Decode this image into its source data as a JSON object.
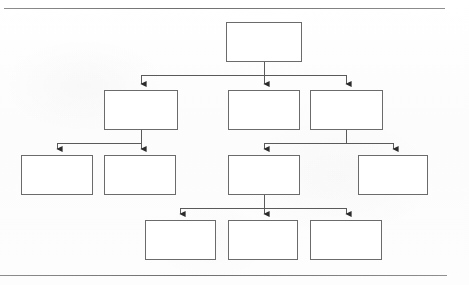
{
  "page": {
    "width": 469,
    "height": 285,
    "background_color": "#fdfdfd",
    "kind": "scanned-hierarchy-diagram"
  },
  "frame": {
    "top_rule": {
      "x": 4,
      "y": 8,
      "width": 441,
      "color": "#6f6f6f"
    },
    "bottom_rule": {
      "x": 0,
      "y": 275,
      "width": 447,
      "color": "#6f6f6f"
    }
  },
  "style": {
    "node_fill": "#ffffff",
    "node_border_color": "#6b6b6b",
    "node_border_width": 1,
    "shadow_color": "#111111",
    "shadow_offset": 3,
    "connector_color": "#5a5a5a",
    "connector_width": 1,
    "arrowhead_color": "#2b2b2b"
  },
  "diagram": {
    "type": "tree",
    "orientation": "top-down",
    "levels": 4,
    "node_count": 12,
    "all_nodes_blank": true,
    "nodes": [
      {
        "id": "n1",
        "label": "",
        "level": 1,
        "x": 226,
        "y": 22,
        "width": 76,
        "height": 40,
        "parent": null
      },
      {
        "id": "n2",
        "label": "",
        "level": 2,
        "x": 104,
        "y": 90,
        "width": 74,
        "height": 40,
        "parent": "n1"
      },
      {
        "id": "n3",
        "label": "",
        "level": 2,
        "x": 228,
        "y": 90,
        "width": 72,
        "height": 40,
        "parent": "n1"
      },
      {
        "id": "n4",
        "label": "",
        "level": 2,
        "x": 310,
        "y": 90,
        "width": 73,
        "height": 40,
        "parent": "n1"
      },
      {
        "id": "n5",
        "label": "",
        "level": 3,
        "x": 21,
        "y": 155,
        "width": 72,
        "height": 40,
        "parent": "n2"
      },
      {
        "id": "n6",
        "label": "",
        "level": 3,
        "x": 104,
        "y": 155,
        "width": 72,
        "height": 40,
        "parent": "n2"
      },
      {
        "id": "n7",
        "label": "",
        "level": 3,
        "x": 228,
        "y": 155,
        "width": 72,
        "height": 40,
        "parent": "n4"
      },
      {
        "id": "n8",
        "label": "",
        "level": 3,
        "x": 358,
        "y": 155,
        "width": 70,
        "height": 40,
        "parent": "n4"
      },
      {
        "id": "n9",
        "label": "",
        "level": 4,
        "x": 145,
        "y": 220,
        "width": 71,
        "height": 40,
        "parent": "n7"
      },
      {
        "id": "n10",
        "label": "",
        "level": 4,
        "x": 228,
        "y": 220,
        "width": 70,
        "height": 40,
        "parent": "n7"
      },
      {
        "id": "n11",
        "label": "",
        "level": 4,
        "x": 310,
        "y": 220,
        "width": 72,
        "height": 40,
        "parent": "n7"
      }
    ],
    "connectors": [
      {
        "from": "n1",
        "to": "n2",
        "bus_y": 75,
        "trunk_x": 264,
        "arrow_x": 141
      },
      {
        "from": "n1",
        "to": "n3",
        "bus_y": 75,
        "trunk_x": 264,
        "arrow_x": 264
      },
      {
        "from": "n1",
        "to": "n4",
        "bus_y": 75,
        "trunk_x": 264,
        "arrow_x": 346
      },
      {
        "from": "n2",
        "to": "n5",
        "bus_y": 143,
        "trunk_x": 141,
        "arrow_x": 57
      },
      {
        "from": "n2",
        "to": "n6",
        "bus_y": 143,
        "trunk_x": 141,
        "arrow_x": 141
      },
      {
        "from": "n4",
        "to": "n7",
        "bus_y": 143,
        "trunk_x": 346,
        "arrow_x": 264
      },
      {
        "from": "n4",
        "to": "n8",
        "bus_y": 143,
        "trunk_x": 346,
        "arrow_x": 393
      },
      {
        "from": "n7",
        "to": "n9",
        "bus_y": 208,
        "trunk_x": 264,
        "arrow_x": 180
      },
      {
        "from": "n7",
        "to": "n10",
        "bus_y": 208,
        "trunk_x": 264,
        "arrow_x": 264
      },
      {
        "from": "n7",
        "to": "n11",
        "bus_y": 208,
        "trunk_x": 264,
        "arrow_x": 346
      }
    ]
  }
}
